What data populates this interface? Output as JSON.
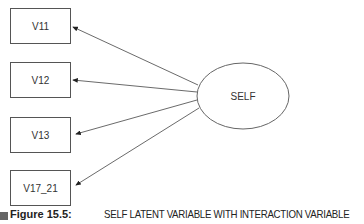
{
  "diagram": {
    "latent": {
      "label": "SELF"
    },
    "indicators": [
      {
        "label": "V11"
      },
      {
        "label": "V12"
      },
      {
        "label": "V13"
      },
      {
        "label": "V17_21"
      }
    ],
    "edges": [
      {
        "from": "SELF",
        "to": "V11"
      },
      {
        "from": "SELF",
        "to": "V12"
      },
      {
        "from": "SELF",
        "to": "V13"
      },
      {
        "from": "SELF",
        "to": "V17_21"
      }
    ]
  },
  "caption": {
    "figure_label": "Figure 15.5:",
    "title": "SELF LATENT VARIABLE WITH INTERACTION VARIABLE"
  }
}
